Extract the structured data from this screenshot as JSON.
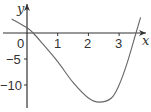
{
  "chart_data": {
    "type": "line",
    "title": "",
    "xlabel": "x",
    "ylabel": "y",
    "xlim": [
      -0.6,
      4.0
    ],
    "ylim": [
      -14,
      3.5
    ],
    "x_ticks": [
      0,
      1,
      2,
      3
    ],
    "x_tick_labels": [
      "0",
      "1",
      "2",
      "3"
    ],
    "y_ticks": [
      -5,
      -10
    ],
    "y_tick_labels": [
      "−5",
      "−10"
    ],
    "grid": false,
    "series": [
      {
        "name": "curve",
        "x": [
          -0.5,
          0,
          0.2,
          0.5,
          1,
          1.5,
          2,
          2.35,
          2.75,
          3,
          3.25,
          3.55,
          3.7
        ],
        "y": [
          2.7,
          1,
          0,
          -2,
          -5.5,
          -9.5,
          -12.5,
          -13.3,
          -12.5,
          -10,
          -6,
          0,
          3
        ]
      }
    ]
  }
}
